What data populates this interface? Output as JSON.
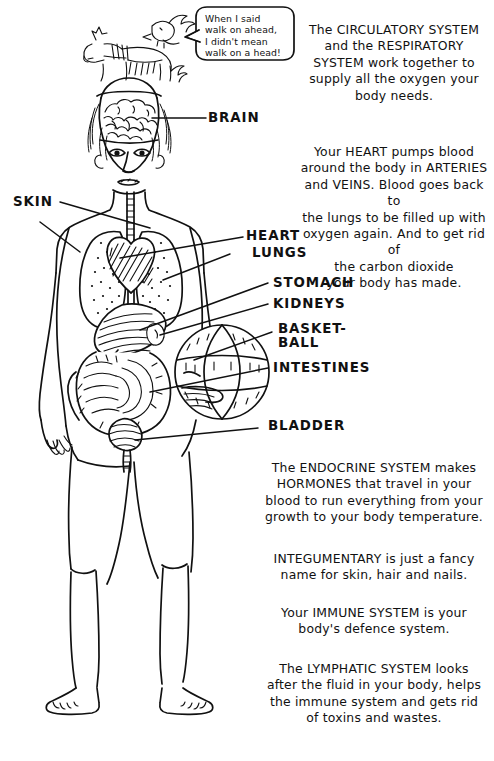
{
  "illustration": {
    "title": "Human body systems cartoon diagram",
    "ink_color": "#111111",
    "background": "#ffffff"
  },
  "speech_bubble": {
    "name": "speech-bubble",
    "lines": [
      "When I said",
      "walk on ahead,",
      "I didn't mean",
      "walk on a head!"
    ]
  },
  "organ_labels": [
    {
      "id": "brain",
      "text": "BRAIN"
    },
    {
      "id": "skin",
      "text": "SKIN"
    },
    {
      "id": "heart",
      "text": "HEART"
    },
    {
      "id": "lungs",
      "text": "LUNGS"
    },
    {
      "id": "stomach",
      "text": "STOMACH"
    },
    {
      "id": "kidneys",
      "text": "KIDNEYS"
    },
    {
      "id": "basketball",
      "text": "BASKET-",
      "text2": "BALL"
    },
    {
      "id": "intestines",
      "text": "INTESTINES"
    },
    {
      "id": "bladder",
      "text": "BLADDER"
    }
  ],
  "text_blocks": {
    "circulatory": {
      "name": "circulatory-respiratory-text",
      "lines": [
        "The CIRCULATORY SYSTEM",
        "and the RESPIRATORY",
        "SYSTEM work together to",
        "supply all the oxygen your",
        "body needs."
      ]
    },
    "heart": {
      "name": "heart-blood-text",
      "lines": [
        "Your HEART pumps blood",
        "around the body in ARTERIES",
        "and VEINS. Blood goes back to",
        "the lungs to be filled up with",
        "oxygen again. And to get rid of",
        "the carbon dioxide",
        "your body has made."
      ]
    },
    "endocrine": {
      "name": "endocrine-text",
      "lines": [
        "The ENDOCRINE SYSTEM makes",
        "HORMONES that travel in your",
        "blood to run everything from your",
        "growth to your body temperature."
      ]
    },
    "integumentary": {
      "name": "integumentary-text",
      "lines": [
        "INTEGUMENTARY is just a fancy",
        "name for skin, hair and nails."
      ]
    },
    "immune": {
      "name": "immune-text",
      "lines": [
        "Your IMMUNE SYSTEM is your",
        "body's defence system."
      ]
    },
    "lymphatic": {
      "name": "lymphatic-text",
      "lines": [
        "The LYMPHATIC SYSTEM looks",
        "after the fluid in your body, helps",
        "the immune system and gets rid",
        "of toxins and wastes."
      ]
    }
  }
}
